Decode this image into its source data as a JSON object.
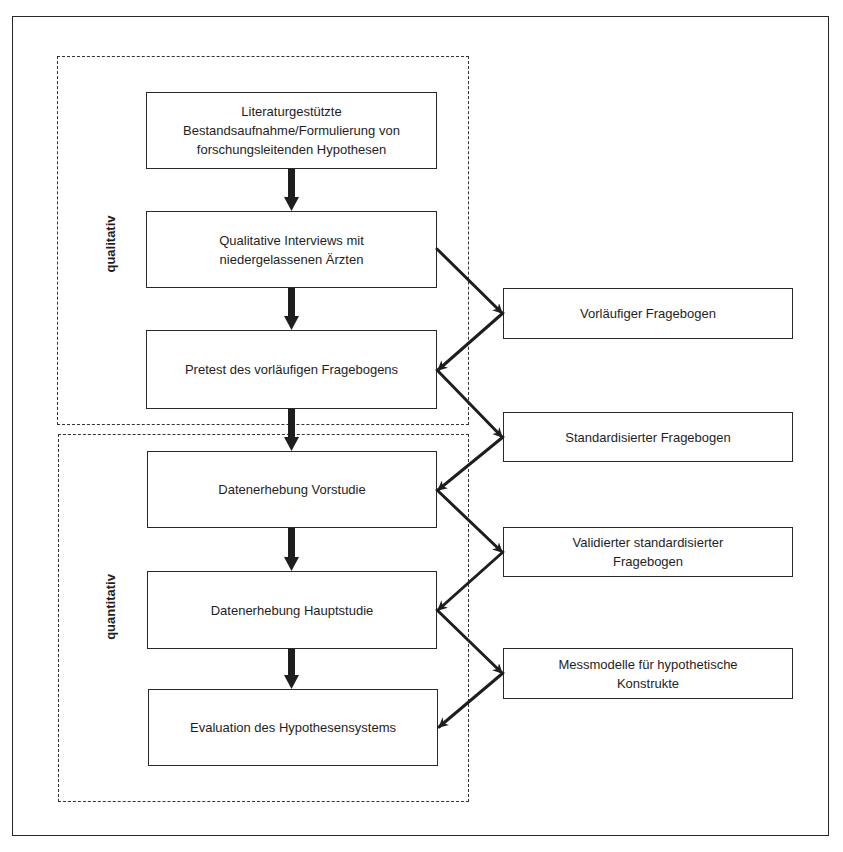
{
  "diagram": {
    "phases": [
      {
        "id": "qualitativ",
        "label": "qualitativ"
      },
      {
        "id": "quantitativ",
        "label": "quantitativ"
      }
    ],
    "process_steps": [
      {
        "id": "step1",
        "label": "Literaturgestützte\nBestandsaufnahme/Formulierung von\nforschungsleitenden Hypothesen"
      },
      {
        "id": "step2",
        "label": "Qualitative Interviews mit\nniedergelassenen Ärzten"
      },
      {
        "id": "step3",
        "label": "Pretest des vorläufigen Fragebogens"
      },
      {
        "id": "step4",
        "label": "Datenerhebung Vorstudie"
      },
      {
        "id": "step5",
        "label": "Datenerhebung Hauptstudie"
      },
      {
        "id": "step6",
        "label": "Evaluation des Hypothesensystems"
      }
    ],
    "outputs": [
      {
        "id": "out1",
        "label": "Vorläufiger Fragebogen"
      },
      {
        "id": "out2",
        "label": "Standardisierter Fragebogen"
      },
      {
        "id": "out3",
        "label": "Validierter standardisierter\nFragebogen"
      },
      {
        "id": "out4",
        "label": "Messmodelle für hypothetische\nKonstrukte"
      }
    ],
    "edges": [
      {
        "from": "step1",
        "to": "step2",
        "style": "thick"
      },
      {
        "from": "step2",
        "to": "step3",
        "style": "thick"
      },
      {
        "from": "step3",
        "to": "step4",
        "style": "thick"
      },
      {
        "from": "step4",
        "to": "step5",
        "style": "thick"
      },
      {
        "from": "step5",
        "to": "step6",
        "style": "thick"
      },
      {
        "from": "step2",
        "to": "out1",
        "style": "diagonal"
      },
      {
        "from": "out1",
        "to": "step3",
        "style": "diagonal"
      },
      {
        "from": "step3",
        "to": "out2",
        "style": "diagonal"
      },
      {
        "from": "out2",
        "to": "step4",
        "style": "diagonal"
      },
      {
        "from": "step4",
        "to": "out3",
        "style": "diagonal"
      },
      {
        "from": "out3",
        "to": "step5",
        "style": "diagonal"
      },
      {
        "from": "step5",
        "to": "out4",
        "style": "diagonal"
      },
      {
        "from": "out4",
        "to": "step6",
        "style": "diagonal"
      }
    ],
    "colors": {
      "line": "#2a2a2a",
      "background": "#ffffff"
    }
  }
}
